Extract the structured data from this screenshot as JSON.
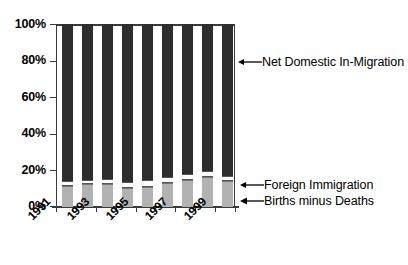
{
  "chart_data": {
    "type": "bar",
    "subtype": "stacked-100-percent",
    "title": "",
    "xlabel": "",
    "ylabel": "",
    "ylim": [
      0,
      100
    ],
    "ytick_labels": [
      "100%",
      "80%",
      "60%",
      "40%",
      "20%",
      "0%"
    ],
    "ytick_values": [
      100,
      80,
      60,
      40,
      20,
      0
    ],
    "grid": true,
    "legend_position": "right-inline-annotations",
    "categories": [
      "1991",
      "1992",
      "1993",
      "1994",
      "1995",
      "1996",
      "1997",
      "1998",
      "1999"
    ],
    "visible_tick_labels": [
      "1991",
      "1993",
      "1995",
      "1997",
      "1999"
    ],
    "series": [
      {
        "name": "Births minus Deaths",
        "color": "#b2b2b2",
        "values": [
          11.5,
          12.5,
          12.5,
          10.5,
          11.0,
          13.0,
          14.5,
          16.5,
          14.0
        ]
      },
      {
        "name": "Foreign Immigration",
        "color": "#fbfbfb",
        "values": [
          2.5,
          2.5,
          3.0,
          3.0,
          3.5,
          3.5,
          3.5,
          3.0,
          3.0
        ]
      },
      {
        "name": "Net Domestic In-Migration",
        "color": "#2d2d2d",
        "values": [
          86.0,
          85.0,
          84.5,
          86.5,
          85.5,
          83.5,
          82.0,
          80.5,
          83.0
        ]
      }
    ],
    "annotations": [
      {
        "label": "Net Domestic In-Migration",
        "target_series": "Net Domestic In-Migration",
        "arrow": "left"
      },
      {
        "label": "Foreign Immigration",
        "target_series": "Foreign Immigration",
        "arrow": "left"
      },
      {
        "label": "Births minus Deaths",
        "target_series": "Births minus Deaths",
        "arrow": "left"
      }
    ]
  },
  "axis": {
    "y_labels": [
      "100%",
      "80%",
      "60%",
      "40%",
      "20%",
      "0%"
    ],
    "x_labels": [
      "1991",
      "1993",
      "1995",
      "1997",
      "1999"
    ]
  },
  "colors": {
    "series_top": "#2d2d2d",
    "series_mid": "#fbfbfb",
    "series_bottom": "#b2b2b2",
    "axis": "#3a3a3a",
    "grid": "#909090",
    "background": "#ffffff"
  }
}
